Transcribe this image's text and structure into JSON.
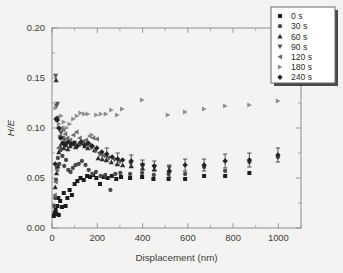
{
  "figure": {
    "background_color": "#f4f3f1",
    "frame_color": "#8d8d8d",
    "axis_text_color": "#3b3b3b"
  },
  "chart_data": {
    "type": "scatter",
    "title": "",
    "xlabel": "Displacement (nm)",
    "ylabel": "H/E",
    "xlim": [
      0,
      1100
    ],
    "ylim": [
      0.0,
      0.2
    ],
    "xticks": [
      0,
      200,
      400,
      600,
      800,
      1000
    ],
    "xtick_labels": [
      "0",
      "200",
      "400",
      "600",
      "800",
      "1000"
    ],
    "xminor_step": 100,
    "yticks": [
      0.0,
      0.05,
      0.1,
      0.15,
      0.2
    ],
    "ytick_labels": [
      "0.00",
      "0.05",
      "0.10",
      "0.15",
      "0.20"
    ],
    "yminor_step": 0.025,
    "grid": false,
    "legend_position": "top-right",
    "series": [
      {
        "name": "0 s",
        "marker": "square",
        "color": "#1c1c1c",
        "points": [
          [
            8,
            0.012
          ],
          [
            12,
            0.015
          ],
          [
            16,
            0.018
          ],
          [
            20,
            0.014
          ],
          [
            24,
            0.022
          ],
          [
            28,
            0.03
          ],
          [
            30,
            0.013
          ],
          [
            36,
            0.027
          ],
          [
            44,
            0.021
          ],
          [
            52,
            0.035
          ],
          [
            60,
            0.022
          ],
          [
            68,
            0.03
          ],
          [
            78,
            0.038
          ],
          [
            88,
            0.033
          ],
          [
            100,
            0.044
          ],
          [
            112,
            0.047
          ],
          [
            126,
            0.05
          ],
          [
            140,
            0.048
          ],
          [
            155,
            0.052
          ],
          [
            168,
            0.051
          ],
          [
            182,
            0.053
          ],
          [
            196,
            0.05
          ],
          [
            212,
            0.044
          ],
          [
            228,
            0.051
          ],
          [
            246,
            0.05
          ],
          [
            264,
            0.052
          ],
          [
            284,
            0.049
          ],
          [
            305,
            0.051
          ],
          [
            345,
            0.05
          ],
          [
            398,
            0.051
          ],
          [
            448,
            0.049
          ],
          [
            515,
            0.049
          ],
          [
            588,
            0.049
          ],
          [
            672,
            0.052
          ],
          [
            765,
            0.052
          ],
          [
            872,
            0.055
          ]
        ]
      },
      {
        "name": "30 s",
        "marker": "circle",
        "color": "#4a4a4a",
        "points": [
          [
            10,
            0.022
          ],
          [
            14,
            0.03
          ],
          [
            18,
            0.048
          ],
          [
            22,
            0.06
          ],
          [
            26,
            0.07
          ],
          [
            32,
            0.064
          ],
          [
            38,
            0.078
          ],
          [
            46,
            0.072
          ],
          [
            54,
            0.062
          ],
          [
            62,
            0.068
          ],
          [
            72,
            0.058
          ],
          [
            82,
            0.056
          ],
          [
            92,
            0.06
          ],
          [
            104,
            0.063
          ],
          [
            118,
            0.064
          ],
          [
            132,
            0.067
          ],
          [
            148,
            0.063
          ],
          [
            162,
            0.058
          ],
          [
            178,
            0.054
          ],
          [
            194,
            0.056
          ],
          [
            215,
            0.052
          ],
          [
            235,
            0.053
          ],
          [
            258,
            0.038
          ],
          [
            280,
            0.054
          ],
          [
            302,
            0.055
          ],
          [
            345,
            0.054
          ],
          [
            398,
            0.055
          ],
          [
            450,
            0.053
          ],
          [
            515,
            0.054
          ],
          [
            588,
            0.054
          ],
          [
            672,
            0.061
          ],
          [
            765,
            0.057
          ],
          [
            872,
            0.066
          ],
          [
            998,
            0.071
          ]
        ]
      },
      {
        "name": "60 s",
        "marker": "triangle-up",
        "color": "#2e2e2e",
        "points": [
          [
            18,
            0.148
          ],
          [
            14,
            0.041
          ],
          [
            20,
            0.055
          ],
          [
            26,
            0.062
          ],
          [
            30,
            0.076
          ],
          [
            36,
            0.082
          ],
          [
            44,
            0.085
          ],
          [
            52,
            0.08
          ],
          [
            60,
            0.083
          ],
          [
            70,
            0.079
          ],
          [
            80,
            0.082
          ],
          [
            92,
            0.084
          ],
          [
            104,
            0.081
          ],
          [
            118,
            0.084
          ],
          [
            130,
            0.085
          ],
          [
            144,
            0.082
          ],
          [
            158,
            0.08
          ],
          [
            172,
            0.083
          ],
          [
            188,
            0.078
          ],
          [
            204,
            0.07
          ],
          [
            222,
            0.069
          ],
          [
            240,
            0.068
          ],
          [
            262,
            0.066
          ],
          [
            288,
            0.064
          ],
          [
            312,
            0.063
          ],
          [
            350,
            0.062
          ],
          [
            400,
            0.06
          ],
          [
            452,
            0.059
          ],
          [
            518,
            0.058
          ]
        ]
      },
      {
        "name": "90 s",
        "marker": "triangle-down",
        "color": "#585858",
        "points": [
          [
            16,
            0.152
          ],
          [
            20,
            0.122
          ],
          [
            24,
            0.124
          ],
          [
            28,
            0.11
          ],
          [
            34,
            0.098
          ],
          [
            40,
            0.095
          ],
          [
            48,
            0.09
          ],
          [
            56,
            0.088
          ],
          [
            66,
            0.084
          ],
          [
            76,
            0.086
          ],
          [
            88,
            0.083
          ],
          [
            100,
            0.085
          ],
          [
            114,
            0.082
          ],
          [
            128,
            0.084
          ],
          [
            142,
            0.086
          ],
          [
            158,
            0.083
          ],
          [
            174,
            0.08
          ],
          [
            192,
            0.077
          ],
          [
            210,
            0.074
          ],
          [
            232,
            0.072
          ],
          [
            252,
            0.07
          ],
          [
            276,
            0.068
          ],
          [
            300,
            0.066
          ],
          [
            348,
            0.064
          ],
          [
            400,
            0.063
          ],
          [
            452,
            0.061
          ],
          [
            518,
            0.06
          ]
        ]
      },
      {
        "name": "120 s",
        "marker": "triangle-left",
        "color": "#6e6e6e",
        "points": [
          [
            12,
            0.033
          ],
          [
            16,
            0.046
          ],
          [
            22,
            0.058
          ],
          [
            28,
            0.08
          ],
          [
            34,
            0.092
          ],
          [
            42,
            0.1
          ],
          [
            50,
            0.098
          ],
          [
            58,
            0.094
          ],
          [
            68,
            0.09
          ],
          [
            80,
            0.088
          ],
          [
            94,
            0.093
          ],
          [
            108,
            0.096
          ],
          [
            122,
            0.09
          ],
          [
            136,
            0.086
          ],
          [
            150,
            0.088
          ],
          [
            166,
            0.092
          ],
          [
            182,
            0.09
          ],
          [
            198,
            0.089
          ],
          [
            216,
            0.073
          ],
          [
            236,
            0.072
          ]
        ]
      },
      {
        "name": "180 s",
        "marker": "triangle-right",
        "color": "#8f8f8f",
        "points": [
          [
            16,
            0.12
          ],
          [
            22,
            0.108
          ],
          [
            30,
            0.104
          ],
          [
            40,
            0.112
          ],
          [
            52,
            0.106
          ],
          [
            64,
            0.1
          ],
          [
            78,
            0.104
          ],
          [
            94,
            0.109
          ],
          [
            110,
            0.112
          ],
          [
            126,
            0.115
          ],
          [
            142,
            0.114
          ],
          [
            158,
            0.114
          ],
          [
            176,
            0.093
          ],
          [
            196,
            0.113
          ],
          [
            216,
            0.114
          ],
          [
            238,
            0.114
          ],
          [
            262,
            0.118
          ],
          [
            288,
            0.113
          ],
          [
            310,
            0.119
          ],
          [
            398,
            0.128
          ],
          [
            512,
            0.113
          ],
          [
            588,
            0.116
          ],
          [
            672,
            0.119
          ],
          [
            765,
            0.122
          ],
          [
            872,
            0.123
          ],
          [
            998,
            0.127
          ]
        ]
      },
      {
        "name": "240 s",
        "marker": "diamond",
        "color": "#232323",
        "points": [
          [
            14,
            0.064
          ],
          [
            18,
            0.109
          ],
          [
            24,
            0.108
          ],
          [
            30,
            0.1
          ],
          [
            38,
            0.09
          ],
          [
            48,
            0.085
          ],
          [
            58,
            0.083
          ],
          [
            70,
            0.086
          ],
          [
            84,
            0.084
          ],
          [
            98,
            0.085
          ],
          [
            112,
            0.082
          ],
          [
            128,
            0.086
          ],
          [
            144,
            0.083
          ],
          [
            160,
            0.085
          ],
          [
            178,
            0.082
          ],
          [
            198,
            0.08
          ],
          [
            220,
            0.076
          ],
          [
            242,
            0.074
          ],
          [
            266,
            0.071
          ],
          [
            290,
            0.069
          ],
          [
            312,
            0.068
          ],
          [
            350,
            0.067
          ],
          [
            400,
            0.063
          ],
          [
            452,
            0.062
          ],
          [
            518,
            0.057
          ],
          [
            588,
            0.063
          ],
          [
            672,
            0.063
          ],
          [
            765,
            0.067
          ],
          [
            872,
            0.068
          ],
          [
            998,
            0.073
          ]
        ],
        "errorbars": [
          [
            242,
            0.074,
            0.006
          ],
          [
            290,
            0.069,
            0.006
          ],
          [
            350,
            0.067,
            0.006
          ],
          [
            400,
            0.063,
            0.005
          ],
          [
            452,
            0.062,
            0.005
          ],
          [
            518,
            0.057,
            0.006
          ],
          [
            588,
            0.063,
            0.006
          ],
          [
            672,
            0.063,
            0.006
          ],
          [
            765,
            0.067,
            0.007
          ],
          [
            872,
            0.068,
            0.007
          ],
          [
            998,
            0.073,
            0.007
          ]
        ]
      }
    ],
    "legend": [
      {
        "label": "0 s",
        "marker": "square",
        "color": "#1c1c1c"
      },
      {
        "label": "30 s",
        "marker": "circle",
        "color": "#4a4a4a"
      },
      {
        "label": "60 s",
        "marker": "triangle-up",
        "color": "#2e2e2e"
      },
      {
        "label": "90 s",
        "marker": "triangle-down",
        "color": "#585858"
      },
      {
        "label": "120 s",
        "marker": "triangle-left",
        "color": "#6e6e6e"
      },
      {
        "label": "180 s",
        "marker": "triangle-right",
        "color": "#8f8f8f"
      },
      {
        "label": "240 s",
        "marker": "diamond",
        "color": "#232323"
      }
    ]
  }
}
